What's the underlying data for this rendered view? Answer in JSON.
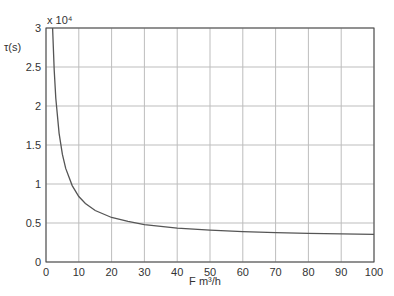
{
  "chart_data": {
    "type": "line",
    "title": "",
    "xlabel": "F  m³/h",
    "ylabel": "τ(s)",
    "y_multiplier": "x 10⁴",
    "xlim": [
      0,
      100
    ],
    "ylim": [
      0,
      3
    ],
    "grid": true,
    "x_ticks": [
      "0",
      "10",
      "20",
      "30",
      "40",
      "50",
      "60",
      "70",
      "80",
      "90",
      "100"
    ],
    "y_ticks": [
      "0",
      "0.5",
      "1",
      "1.5",
      "2",
      "2.5",
      "3"
    ],
    "series": [
      {
        "name": "τ",
        "color": "#555555",
        "x": [
          2,
          2.5,
          3,
          4,
          5,
          6,
          8,
          10,
          12,
          15,
          20,
          25,
          30,
          40,
          50,
          60,
          70,
          80,
          90,
          100
        ],
        "y": [
          3.0,
          2.46,
          2.1,
          1.65,
          1.38,
          1.2,
          0.98,
          0.84,
          0.75,
          0.66,
          0.57,
          0.52,
          0.48,
          0.435,
          0.408,
          0.39,
          0.377,
          0.368,
          0.36,
          0.354
        ]
      }
    ]
  }
}
